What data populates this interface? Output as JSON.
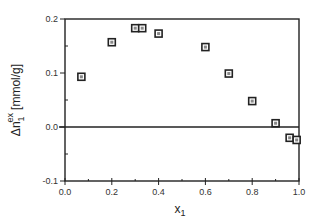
{
  "chart_data": {
    "type": "scatter",
    "title": "",
    "xlabel": "x",
    "xlabel_sub": "1",
    "ylabel_prefix": "Δn",
    "ylabel_sup": "ex",
    "ylabel_sub": "1",
    "ylabel_unit": "[mmol/g]",
    "xlim": [
      0.0,
      1.0
    ],
    "ylim": [
      -0.1,
      0.2
    ],
    "x_ticks": [
      0.0,
      0.2,
      0.4,
      0.6,
      0.8,
      1.0
    ],
    "x_tick_labels": [
      "0.0",
      "0.2",
      "0.4",
      "0.6",
      "0.8",
      "1.0"
    ],
    "y_ticks": [
      -0.1,
      0.0,
      0.1,
      0.2
    ],
    "y_tick_labels": [
      "-0.1",
      "0.0",
      "0.1",
      "0.2"
    ],
    "grid": false,
    "zero_line": true,
    "marker": "square",
    "series": [
      {
        "name": "Δn1ex",
        "x": [
          0.07,
          0.2,
          0.3,
          0.33,
          0.4,
          0.6,
          0.7,
          0.8,
          0.9,
          0.96,
          0.99
        ],
        "y": [
          0.093,
          0.157,
          0.183,
          0.183,
          0.173,
          0.148,
          0.099,
          0.048,
          0.007,
          -0.02,
          -0.024
        ]
      }
    ]
  },
  "colors": {
    "axis": "#222222",
    "marker_edge": "#222222",
    "marker_fill": "#888888"
  }
}
